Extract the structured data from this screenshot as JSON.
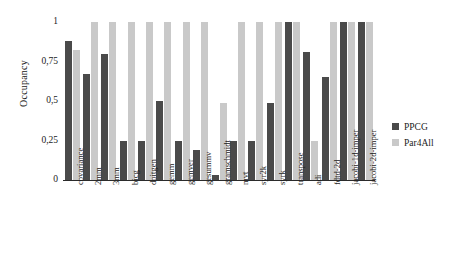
{
  "chart_data": {
    "type": "bar",
    "title": "",
    "xlabel": "",
    "ylabel": "Occupancy",
    "ylim": [
      0,
      1
    ],
    "ytick_labels": [
      "0",
      "0,25",
      "0,5",
      "0,75",
      "1"
    ],
    "ytick_values": [
      0,
      0.25,
      0.5,
      0.75,
      1
    ],
    "grid": false,
    "legend_position": "right",
    "categories": [
      "covariance",
      "2mm",
      "3mm",
      "bicg",
      "doitgen",
      "gemm",
      "gemver",
      "gesummv",
      "gramschmidt",
      "mvt",
      "syr2k",
      "syrk",
      "transpose",
      "adi",
      "fdtd-2d",
      "jacobi-1d-imper",
      "jacobi-2d-imper"
    ],
    "series": [
      {
        "name": "PPCG",
        "color": "#4a4a4a",
        "values": [
          0.88,
          0.67,
          0.8,
          0.25,
          0.25,
          0.5,
          0.25,
          0.19,
          0.03,
          0.25,
          0.25,
          0.49,
          1.0,
          0.81,
          0.65,
          1.0,
          1.0
        ]
      },
      {
        "name": "Par4All",
        "color": "#c9c9c9",
        "values": [
          0.82,
          1.0,
          1.0,
          1.0,
          1.0,
          1.0,
          1.0,
          1.0,
          0.49,
          1.0,
          1.0,
          1.0,
          1.0,
          0.25,
          1.0,
          1.0,
          1.0
        ]
      }
    ]
  },
  "legend": {
    "items": [
      {
        "label": "PPCG"
      },
      {
        "label": "Par4All"
      }
    ]
  },
  "axis": {
    "y_title": "Occupancy"
  }
}
